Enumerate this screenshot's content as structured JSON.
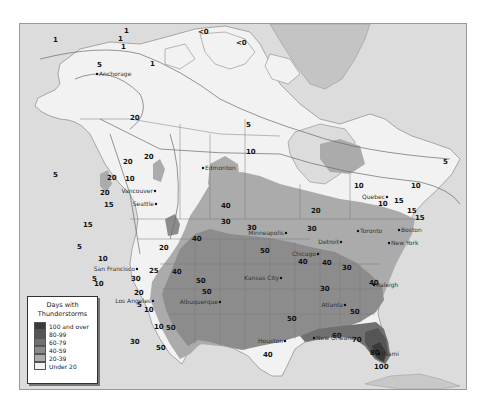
{
  "legend": {
    "title_line1": "Days with",
    "title_line2": "Thunderstorms",
    "items": [
      {
        "label": "100 and over",
        "color": "#3a3a3a"
      },
      {
        "label": "80-99",
        "color": "#555555"
      },
      {
        "label": "60-79",
        "color": "#707070"
      },
      {
        "label": "40-59",
        "color": "#8c8c8c"
      },
      {
        "label": "20-39",
        "color": "#ababab"
      },
      {
        "label": "Under 20",
        "color": "#f2f2f2"
      }
    ]
  },
  "colors": {
    "ocean": "#dcdcdc",
    "land_under20": "#f2f2f2",
    "band_20_39": "#ababab",
    "band_40_59": "#8c8c8c",
    "band_60_79": "#707070",
    "band_80_99": "#555555",
    "band_100_over": "#3a3a3a",
    "greenland": "#c4c4c4",
    "borders": "#7a7a7a"
  },
  "cities": [
    {
      "name": "Anchorage",
      "x": 96,
      "y": 73
    },
    {
      "name": "Edmonton",
      "x": 202,
      "y": 167
    },
    {
      "name": "Vancouver",
      "x": 154,
      "y": 190
    },
    {
      "name": "Seattle",
      "x": 155,
      "y": 203
    },
    {
      "name": "San Francisco",
      "x": 136,
      "y": 268
    },
    {
      "name": "Los Angeles",
      "x": 152,
      "y": 300
    },
    {
      "name": "Albuquerque",
      "x": 219,
      "y": 301
    },
    {
      "name": "Minneapolis",
      "x": 285,
      "y": 232
    },
    {
      "name": "Kansas City",
      "x": 280,
      "y": 277
    },
    {
      "name": "Chicago",
      "x": 317,
      "y": 253
    },
    {
      "name": "Detroit",
      "x": 340,
      "y": 241
    },
    {
      "name": "Toronto",
      "x": 357,
      "y": 230
    },
    {
      "name": "Quebec",
      "x": 386,
      "y": 196
    },
    {
      "name": "Boston",
      "x": 398,
      "y": 229
    },
    {
      "name": "New York",
      "x": 388,
      "y": 242
    },
    {
      "name": "Raleigh",
      "x": 373,
      "y": 284
    },
    {
      "name": "Atlanta",
      "x": 344,
      "y": 304
    },
    {
      "name": "Houston",
      "x": 284,
      "y": 340
    },
    {
      "name": "New Orleans",
      "x": 313,
      "y": 337
    },
    {
      "name": "Miami",
      "x": 378,
      "y": 353
    }
  ],
  "contour_labels": [
    {
      "text": "1",
      "x": 33,
      "y": 18
    },
    {
      "text": "1",
      "x": 104,
      "y": 9
    },
    {
      "text": "5",
      "x": 77,
      "y": 43
    },
    {
      "text": "1",
      "x": 101,
      "y": 25
    },
    {
      "text": "1",
      "x": 130,
      "y": 42
    },
    {
      "text": "1",
      "x": 98,
      "y": 17
    },
    {
      "text": "<0",
      "x": 178,
      "y": 10
    },
    {
      "text": "<0",
      "x": 216,
      "y": 21
    },
    {
      "text": "5",
      "x": 226,
      "y": 103
    },
    {
      "text": "20",
      "x": 103,
      "y": 140
    },
    {
      "text": "10",
      "x": 105,
      "y": 157
    },
    {
      "text": "20",
      "x": 124,
      "y": 135
    },
    {
      "text": "5",
      "x": 33,
      "y": 153
    },
    {
      "text": "20",
      "x": 87,
      "y": 156
    },
    {
      "text": "20",
      "x": 110,
      "y": 96
    },
    {
      "text": "20",
      "x": 80,
      "y": 171
    },
    {
      "text": "15",
      "x": 84,
      "y": 183
    },
    {
      "text": "10",
      "x": 226,
      "y": 130
    },
    {
      "text": "10",
      "x": 334,
      "y": 164
    },
    {
      "text": "10",
      "x": 391,
      "y": 164
    },
    {
      "text": "5",
      "x": 423,
      "y": 140
    },
    {
      "text": "20",
      "x": 291,
      "y": 189
    },
    {
      "text": "30",
      "x": 227,
      "y": 206
    },
    {
      "text": "15",
      "x": 374,
      "y": 179
    },
    {
      "text": "15",
      "x": 395,
      "y": 196
    },
    {
      "text": "15",
      "x": 387,
      "y": 189
    },
    {
      "text": "10",
      "x": 358,
      "y": 182
    },
    {
      "text": "30",
      "x": 322,
      "y": 246
    },
    {
      "text": "30",
      "x": 287,
      "y": 207
    },
    {
      "text": "40",
      "x": 302,
      "y": 241
    },
    {
      "text": "50",
      "x": 240,
      "y": 229
    },
    {
      "text": "40",
      "x": 201,
      "y": 184
    },
    {
      "text": "30",
      "x": 201,
      "y": 200
    },
    {
      "text": "20",
      "x": 139,
      "y": 226
    },
    {
      "text": "25",
      "x": 129,
      "y": 249
    },
    {
      "text": "40",
      "x": 152,
      "y": 250
    },
    {
      "text": "40",
      "x": 172,
      "y": 217
    },
    {
      "text": "50",
      "x": 182,
      "y": 270
    },
    {
      "text": "50",
      "x": 176,
      "y": 259
    },
    {
      "text": "50",
      "x": 136,
      "y": 326
    },
    {
      "text": "50",
      "x": 146,
      "y": 306
    },
    {
      "text": "40",
      "x": 243,
      "y": 333
    },
    {
      "text": "50",
      "x": 267,
      "y": 297
    },
    {
      "text": "40",
      "x": 278,
      "y": 240
    },
    {
      "text": "30",
      "x": 300,
      "y": 267
    },
    {
      "text": "40",
      "x": 349,
      "y": 261
    },
    {
      "text": "50",
      "x": 330,
      "y": 290
    },
    {
      "text": "60",
      "x": 312,
      "y": 314
    },
    {
      "text": "70",
      "x": 332,
      "y": 318
    },
    {
      "text": "80",
      "x": 350,
      "y": 331
    },
    {
      "text": "100",
      "x": 354,
      "y": 345
    },
    {
      "text": "30",
      "x": 111,
      "y": 257
    },
    {
      "text": "20",
      "x": 114,
      "y": 271
    },
    {
      "text": "10",
      "x": 78,
      "y": 237
    },
    {
      "text": "5",
      "x": 72,
      "y": 257
    },
    {
      "text": "10",
      "x": 74,
      "y": 262
    },
    {
      "text": "5",
      "x": 117,
      "y": 283
    },
    {
      "text": "10",
      "x": 124,
      "y": 288
    },
    {
      "text": "10",
      "x": 134,
      "y": 305
    },
    {
      "text": "5",
      "x": 57,
      "y": 225
    },
    {
      "text": "15",
      "x": 63,
      "y": 203
    },
    {
      "text": "30",
      "x": 110,
      "y": 320
    }
  ]
}
